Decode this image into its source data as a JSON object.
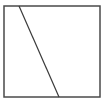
{
  "diagram": {
    "type": "geometry",
    "shapes": [
      {
        "kind": "square",
        "x": 4,
        "y": 6,
        "width": 96,
        "height": 91,
        "stroke": "#4a4a4a",
        "stroke_width": 1.5,
        "fill": "none"
      },
      {
        "kind": "line",
        "x1": 19,
        "y1": 6,
        "x2": 59,
        "y2": 97,
        "stroke": "#3a3a3a",
        "stroke_width": 1.2
      }
    ],
    "background": "#ffffff"
  }
}
